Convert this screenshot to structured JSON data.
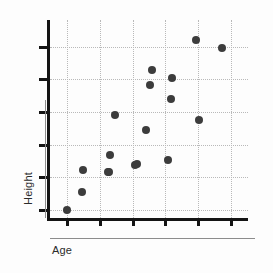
{
  "chart_data": {
    "type": "scatter",
    "title": "",
    "xlabel": "Age",
    "ylabel": "Height",
    "grid": true,
    "legend": false,
    "xlim": [
      0,
      10
    ],
    "ylim": [
      0,
      10
    ],
    "x_tick_count": 6,
    "y_tick_count": 6,
    "x_tick_labels": [
      "",
      "",
      "",
      "",
      "",
      ""
    ],
    "y_tick_labels": [
      "",
      "",
      "",
      "",
      "",
      ""
    ],
    "x_tick_positions": [
      0.875,
      2.525,
      4.175,
      5.825,
      7.475,
      9.125
    ],
    "y_tick_positions": [
      0.4,
      2.05,
      3.7,
      5.35,
      7.0,
      8.65
    ],
    "gridlines_x": [
      0.875,
      2.525,
      4.175,
      5.825,
      7.475,
      9.125
    ],
    "gridlines_y": [
      0.4,
      2.05,
      3.7,
      5.35,
      7.0,
      8.65
    ],
    "marker": "circle",
    "marker_color": "#3c3c3c",
    "marker_size_px": 8,
    "point_count": 18,
    "points": [
      {
        "x": 0.86,
        "y": 0.4
      },
      {
        "x": 1.62,
        "y": 1.31
      },
      {
        "x": 1.67,
        "y": 2.43
      },
      {
        "x": 2.97,
        "y": 2.31
      },
      {
        "x": 3.02,
        "y": 3.19
      },
      {
        "x": 3.27,
        "y": 5.2
      },
      {
        "x": 4.37,
        "y": 2.72
      },
      {
        "x": 4.83,
        "y": 4.46
      },
      {
        "x": 5.03,
        "y": 6.72
      },
      {
        "x": 5.13,
        "y": 7.48
      },
      {
        "x": 5.98,
        "y": 2.95
      },
      {
        "x": 6.13,
        "y": 6.0
      },
      {
        "x": 6.18,
        "y": 7.05
      },
      {
        "x": 7.37,
        "y": 8.97
      },
      {
        "x": 7.52,
        "y": 4.95
      },
      {
        "x": 8.67,
        "y": 8.6
      },
      {
        "x": 4.28,
        "y": 2.7
      },
      {
        "x": 2.92,
        "y": 2.33
      }
    ],
    "axis_color": "#141414",
    "grid_color": "#b9b9b9",
    "rule_color": "#8c8c8c",
    "background": "#fdfdfd"
  },
  "axes": {
    "x_title": "Age",
    "y_title": "Height"
  }
}
